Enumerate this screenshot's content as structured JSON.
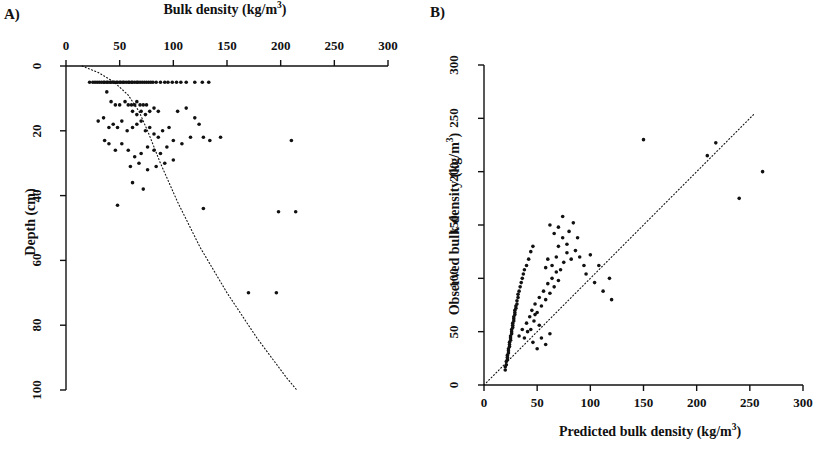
{
  "figure": {
    "background": "#ffffff",
    "ink": "#111111",
    "panels": [
      {
        "letter": "A)",
        "label_pos": {
          "x": 4,
          "y": 8
        }
      },
      {
        "letter": "B)",
        "label_pos": {
          "x": 430,
          "y": 6
        }
      }
    ]
  },
  "panel_a": {
    "letter": "A)",
    "title": "Bulk density (kg/m",
    "title_sup": "3",
    "title_tail": ")",
    "ylabel": "Depth (cm)",
    "x_ticks": [
      "0",
      "50",
      "100",
      "150",
      "200",
      "250",
      "300"
    ],
    "y_ticks": [
      "0",
      "20",
      "40",
      "60",
      "80",
      "100"
    ],
    "plot_box": {
      "left": 66,
      "right": 388,
      "top": 66,
      "bottom": 390
    }
  },
  "panel_b": {
    "letter": "B)",
    "xlabel": "Predicted bulk density (kg/m",
    "xlabel_sup": "3",
    "xlabel_tail": ")",
    "ylabel": "Observed bulk density (kg/m",
    "ylabel_sup": "3",
    "ylabel_tail": ")",
    "x_ticks": [
      "0",
      "50",
      "100",
      "150",
      "200",
      "250",
      "300"
    ],
    "y_ticks": [
      "0",
      "50",
      "100",
      "150",
      "200",
      "250",
      "300"
    ],
    "plot_box": {
      "left": 484,
      "right": 803,
      "top": 65,
      "bottom": 385
    }
  },
  "chart_data": [
    {
      "type": "scatter",
      "panel": "A",
      "title": "Bulk density (kg/m3)",
      "xlabel": "Bulk density (kg/m3)",
      "ylabel": "Depth (cm)",
      "xlim": [
        0,
        300
      ],
      "ylim": [
        0,
        100
      ],
      "y_inverted": true,
      "x_ticks": [
        0,
        50,
        100,
        150,
        200,
        250,
        300
      ],
      "y_ticks": [
        0,
        20,
        40,
        60,
        80,
        100
      ],
      "grid": false,
      "legend": null,
      "annotations": [
        "dotted trend curve from (15,0) descending to (~215,100)"
      ],
      "trend_line": {
        "style": "dotted",
        "points": [
          [
            15,
            0
          ],
          [
            30,
            2
          ],
          [
            45,
            5
          ],
          [
            58,
            9
          ],
          [
            68,
            14
          ],
          [
            76,
            20
          ],
          [
            88,
            30
          ],
          [
            104,
            42
          ],
          [
            125,
            56
          ],
          [
            150,
            70
          ],
          [
            178,
            84
          ],
          [
            205,
            96
          ],
          [
            215,
            100
          ]
        ]
      },
      "points": [
        [
          22,
          5
        ],
        [
          25,
          5
        ],
        [
          27,
          5
        ],
        [
          29,
          5
        ],
        [
          31,
          5
        ],
        [
          33,
          5
        ],
        [
          35,
          5
        ],
        [
          36,
          5
        ],
        [
          38,
          5
        ],
        [
          39,
          5
        ],
        [
          41,
          5
        ],
        [
          42,
          5
        ],
        [
          44,
          5
        ],
        [
          45,
          5
        ],
        [
          47,
          5
        ],
        [
          48,
          5
        ],
        [
          50,
          5
        ],
        [
          51,
          5
        ],
        [
          53,
          5
        ],
        [
          54,
          5
        ],
        [
          56,
          5
        ],
        [
          58,
          5
        ],
        [
          59,
          5
        ],
        [
          61,
          5
        ],
        [
          62,
          5
        ],
        [
          64,
          5
        ],
        [
          66,
          5
        ],
        [
          67,
          5
        ],
        [
          69,
          5
        ],
        [
          71,
          5
        ],
        [
          73,
          5
        ],
        [
          75,
          5
        ],
        [
          77,
          5
        ],
        [
          79,
          5
        ],
        [
          81,
          5
        ],
        [
          84,
          5
        ],
        [
          88,
          5
        ],
        [
          92,
          5
        ],
        [
          95,
          5
        ],
        [
          99,
          5
        ],
        [
          103,
          5
        ],
        [
          107,
          5
        ],
        [
          112,
          5
        ],
        [
          120,
          5
        ],
        [
          127,
          5
        ],
        [
          133,
          5
        ],
        [
          38,
          8
        ],
        [
          42,
          11
        ],
        [
          46,
          12
        ],
        [
          50,
          12
        ],
        [
          55,
          11
        ],
        [
          58,
          12
        ],
        [
          61,
          12
        ],
        [
          64,
          12
        ],
        [
          66,
          11
        ],
        [
          69,
          12
        ],
        [
          72,
          12
        ],
        [
          75,
          12
        ],
        [
          62,
          14
        ],
        [
          66,
          15
        ],
        [
          70,
          14
        ],
        [
          74,
          15
        ],
        [
          78,
          14
        ],
        [
          82,
          13
        ],
        [
          86,
          14
        ],
        [
          30,
          17
        ],
        [
          35,
          16
        ],
        [
          40,
          19
        ],
        [
          44,
          18
        ],
        [
          48,
          19
        ],
        [
          52,
          17
        ],
        [
          57,
          20
        ],
        [
          62,
          19
        ],
        [
          66,
          18
        ],
        [
          70,
          17
        ],
        [
          74,
          20
        ],
        [
          78,
          19
        ],
        [
          82,
          21
        ],
        [
          86,
          22
        ],
        [
          90,
          20
        ],
        [
          96,
          19
        ],
        [
          104,
          14
        ],
        [
          112,
          13
        ],
        [
          120,
          16
        ],
        [
          124,
          18
        ],
        [
          116,
          22
        ],
        [
          108,
          24
        ],
        [
          100,
          23
        ],
        [
          94,
          25
        ],
        [
          88,
          27
        ],
        [
          82,
          26
        ],
        [
          76,
          25
        ],
        [
          70,
          27
        ],
        [
          64,
          28
        ],
        [
          58,
          26
        ],
        [
          52,
          24
        ],
        [
          46,
          26
        ],
        [
          40,
          24
        ],
        [
          36,
          23
        ],
        [
          60,
          31
        ],
        [
          68,
          30
        ],
        [
          76,
          32
        ],
        [
          84,
          31
        ],
        [
          92,
          30
        ],
        [
          100,
          29
        ],
        [
          128,
          22
        ],
        [
          134,
          23
        ],
        [
          62,
          36
        ],
        [
          72,
          38
        ],
        [
          48,
          43
        ],
        [
          128,
          44
        ],
        [
          144,
          22
        ],
        [
          210,
          23
        ],
        [
          198,
          45
        ],
        [
          214,
          45
        ],
        [
          170,
          70
        ],
        [
          196,
          70
        ]
      ]
    },
    {
      "type": "scatter",
      "panel": "B",
      "title": "",
      "xlabel": "Predicted bulk density (kg/m3)",
      "ylabel": "Observed bulk density (kg/m3)",
      "xlim": [
        0,
        300
      ],
      "ylim": [
        0,
        300
      ],
      "x_ticks": [
        0,
        50,
        100,
        150,
        200,
        250,
        300
      ],
      "y_ticks": [
        0,
        50,
        100,
        150,
        200,
        250,
        300
      ],
      "grid": false,
      "legend": null,
      "annotations": [
        "dotted 1:1 reference line from (0,0) to (255,255)"
      ],
      "trend_line": {
        "style": "dotted",
        "points": [
          [
            0,
            0
          ],
          [
            255,
            255
          ]
        ]
      },
      "points": [
        [
          20,
          14
        ],
        [
          20,
          17
        ],
        [
          21,
          19
        ],
        [
          21,
          22
        ],
        [
          22,
          24
        ],
        [
          22,
          26
        ],
        [
          22,
          28
        ],
        [
          23,
          30
        ],
        [
          23,
          32
        ],
        [
          23,
          34
        ],
        [
          24,
          36
        ],
        [
          24,
          38
        ],
        [
          24,
          40
        ],
        [
          25,
          42
        ],
        [
          25,
          44
        ],
        [
          25,
          46
        ],
        [
          26,
          48
        ],
        [
          26,
          50
        ],
        [
          26,
          52
        ],
        [
          27,
          54
        ],
        [
          27,
          56
        ],
        [
          27,
          58
        ],
        [
          28,
          60
        ],
        [
          28,
          62
        ],
        [
          28,
          64
        ],
        [
          29,
          66
        ],
        [
          29,
          68
        ],
        [
          29,
          70
        ],
        [
          30,
          72
        ],
        [
          30,
          74
        ],
        [
          31,
          76
        ],
        [
          31,
          79
        ],
        [
          32,
          82
        ],
        [
          32,
          85
        ],
        [
          33,
          88
        ],
        [
          34,
          92
        ],
        [
          35,
          96
        ],
        [
          36,
          100
        ],
        [
          37,
          104
        ],
        [
          38,
          108
        ],
        [
          40,
          112
        ],
        [
          42,
          118
        ],
        [
          44,
          125
        ],
        [
          46,
          130
        ],
        [
          33,
          46
        ],
        [
          36,
          52
        ],
        [
          38,
          44
        ],
        [
          40,
          58
        ],
        [
          41,
          50
        ],
        [
          43,
          64
        ],
        [
          45,
          70
        ],
        [
          47,
          60
        ],
        [
          48,
          76
        ],
        [
          50,
          68
        ],
        [
          52,
          82
        ],
        [
          54,
          74
        ],
        [
          56,
          88
        ],
        [
          58,
          80
        ],
        [
          60,
          95
        ],
        [
          62,
          86
        ],
        [
          64,
          100
        ],
        [
          66,
          92
        ],
        [
          68,
          106
        ],
        [
          70,
          98
        ],
        [
          58,
          110
        ],
        [
          60,
          118
        ],
        [
          64,
          112
        ],
        [
          68,
          120
        ],
        [
          72,
          108
        ],
        [
          75,
          115
        ],
        [
          78,
          124
        ],
        [
          82,
          118
        ],
        [
          70,
          130
        ],
        [
          74,
          138
        ],
        [
          66,
          142
        ],
        [
          78,
          132
        ],
        [
          86,
          126
        ],
        [
          90,
          120
        ],
        [
          94,
          112
        ],
        [
          62,
          150
        ],
        [
          70,
          148
        ],
        [
          80,
          144
        ],
        [
          88,
          138
        ],
        [
          74,
          158
        ],
        [
          84,
          152
        ],
        [
          96,
          104
        ],
        [
          104,
          96
        ],
        [
          112,
          88
        ],
        [
          120,
          80
        ],
        [
          118,
          100
        ],
        [
          108,
          112
        ],
        [
          100,
          122
        ],
        [
          44,
          52
        ],
        [
          46,
          40
        ],
        [
          50,
          34
        ],
        [
          54,
          44
        ],
        [
          58,
          38
        ],
        [
          62,
          48
        ],
        [
          52,
          56
        ],
        [
          48,
          66
        ],
        [
          150,
          230
        ],
        [
          210,
          215
        ],
        [
          218,
          227
        ],
        [
          240,
          175
        ],
        [
          262,
          200
        ]
      ]
    }
  ]
}
